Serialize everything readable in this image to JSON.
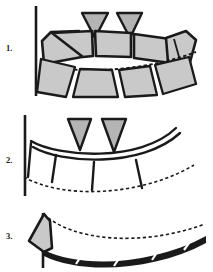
{
  "figure": {
    "background_color": "#FFFFFF",
    "ink_color": "#1A1A1A",
    "fill_color": "#C9C9C9",
    "dashed_color": "#1A1A1A",
    "panel_count": 3
  },
  "panels": [
    {
      "label": "1.",
      "name": "panel-one",
      "description": "Upper row of five shaded trapezoid segments above a dashed arc, with a lower row of four shaded segments; two solid triangular markers above centre; vertical reference line at left.",
      "upper_segment_count": 5,
      "lower_segment_count": 4,
      "triangle_marker_count": 2,
      "dashed_arc_count": 1,
      "vertical_reference_line": true
    },
    {
      "label": "2.",
      "name": "panel-two",
      "description": "Thin outlined arch band with four downward spur projections, two solid triangular markers above, and a dashed arc below; vertical reference line at left.",
      "upper_segment_count": 0,
      "spur_count": 4,
      "triangle_marker_count": 2,
      "dashed_arc_count": 1,
      "vertical_reference_line": true
    },
    {
      "label": "3.",
      "name": "panel-three",
      "description": "Single shaded wedge at left with a long dashed arc sweeping right above a dark banded arch containing four small segment gaps; vertical reference line at left.",
      "wedge_count": 1,
      "band_segment_count": 4,
      "triangle_marker_count": 0,
      "dashed_arc_count": 1,
      "vertical_reference_line": true
    }
  ],
  "markers": {
    "triangle_name": "triangle-marker",
    "triangle_fill": "#B4B4B4",
    "triangle_stroke": "#1A1A1A",
    "panel1_triangles": 2,
    "panel2_triangles": 2
  }
}
